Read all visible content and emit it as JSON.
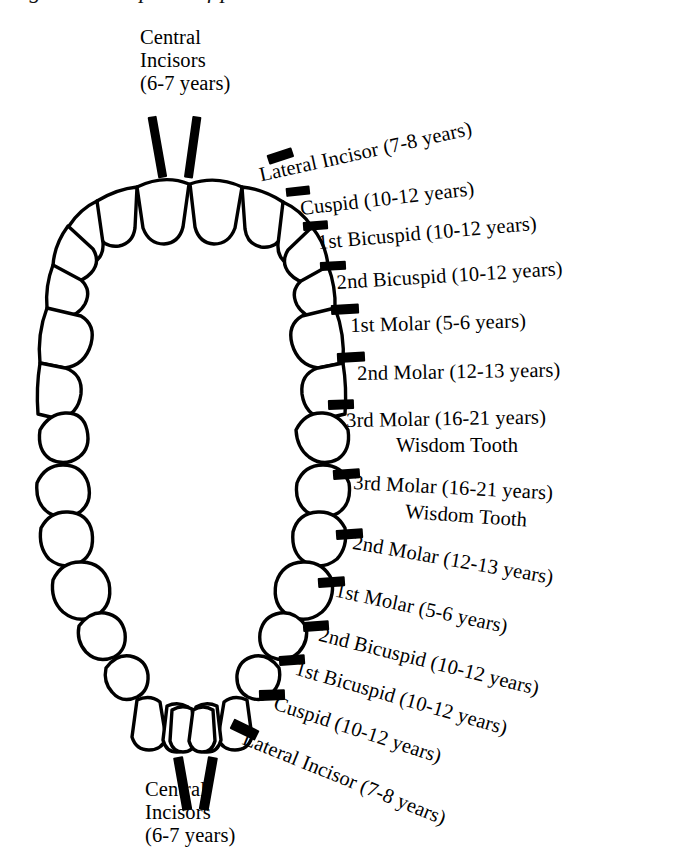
{
  "page": {
    "title_clipped": "Figure 3. Eruption of permanent teeth",
    "background": "#ffffff",
    "ink": "#000000",
    "width": 684,
    "height": 862
  },
  "diagram": {
    "type": "dental-arch-eruption-chart",
    "upper_arch": {
      "name": "Upper (maxillary) arch",
      "tooth_count": 16
    },
    "lower_arch": {
      "name": "Lower (mandibular) arch",
      "tooth_count": 16
    }
  },
  "labels": {
    "upper_central": {
      "line1": "Central",
      "line2": "Incisors",
      "line3": "(6-7 years)",
      "text": "Central\nIncisors\n(6-7 years)"
    },
    "lower_central": {
      "line1": "Central",
      "line2": "Incisors",
      "line3": "(6-7 years)",
      "text": "Central\nIncisors\n(6-7 years)"
    },
    "upper_right": [
      {
        "name": "lateral-incisor",
        "text": "Lateral Incisor (7-8 years)"
      },
      {
        "name": "cuspid",
        "text": "Cuspid (10-12 years)"
      },
      {
        "name": "first-bicuspid",
        "text": "1st Bicuspid (10-12 years)"
      },
      {
        "name": "second-bicuspid",
        "text": "2nd Bicuspid (10-12 years)"
      },
      {
        "name": "first-molar",
        "text": "1st Molar (5-6 years)"
      },
      {
        "name": "second-molar",
        "text": "2nd Molar (12-13 years)"
      },
      {
        "name": "third-molar",
        "text": "3rd Molar (16-21 years)"
      },
      {
        "name": "wisdom-tooth",
        "text": "Wisdom Tooth"
      }
    ],
    "lower_right": [
      {
        "name": "third-molar",
        "text": "3rd Molar (16-21 years)"
      },
      {
        "name": "wisdom-tooth",
        "text": "Wisdom Tooth"
      },
      {
        "name": "second-molar",
        "text": "2nd Molar (12-13 years)"
      },
      {
        "name": "first-molar",
        "text": "1st Molar (5-6 years)"
      },
      {
        "name": "second-bicuspid",
        "text": "2nd Bicuspid (10-12 years)"
      },
      {
        "name": "first-bicuspid",
        "text": "1st Bicuspid (10-12 years)"
      },
      {
        "name": "cuspid",
        "text": "Cuspid (10-12 years)"
      },
      {
        "name": "lateral-incisor",
        "text": "Lateral Incisor (7-8 years)"
      }
    ]
  }
}
